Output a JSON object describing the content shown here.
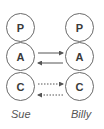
{
  "people": [
    {
      "name": "Sue",
      "states": [
        "P",
        "A",
        "C"
      ]
    },
    {
      "name": "Billy",
      "states": [
        "P",
        "A",
        "C"
      ]
    }
  ],
  "transactions": [
    {
      "from": "Sue.A",
      "to": "Billy.A",
      "style": "solid"
    },
    {
      "from": "Billy.A",
      "to": "Sue.A",
      "style": "solid"
    },
    {
      "from": "Sue.C",
      "to": "Billy.C",
      "style": "dotted"
    },
    {
      "from": "Billy.C",
      "to": "Sue.C",
      "style": "dotted"
    }
  ],
  "colors": {
    "stroke": "#6a6a6a",
    "text": "#3a3a3a",
    "label": "#555555"
  }
}
